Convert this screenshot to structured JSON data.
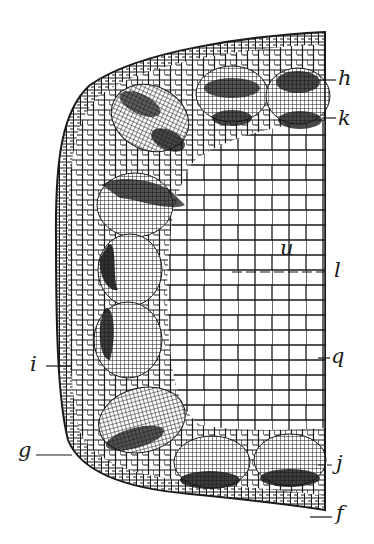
{
  "figure": {
    "type": "botanical stem cross-section (half view)",
    "colors": {
      "ink": "#1a1a1a",
      "background": "#ffffff"
    }
  },
  "labels": {
    "h": {
      "text": "h",
      "x": 338,
      "y": 72
    },
    "k": {
      "text": "k",
      "x": 338,
      "y": 115
    },
    "u": {
      "text": "u",
      "x": 284,
      "y": 240
    },
    "l": {
      "text": "l",
      "x": 334,
      "y": 263
    },
    "q": {
      "text": "q",
      "x": 331,
      "y": 345
    },
    "i": {
      "text": "i",
      "x": 30,
      "y": 355
    },
    "g": {
      "text": "g",
      "x": 20,
      "y": 443
    },
    "j": {
      "text": "j",
      "x": 336,
      "y": 456
    },
    "f": {
      "text": "f",
      "x": 336,
      "y": 505
    }
  }
}
